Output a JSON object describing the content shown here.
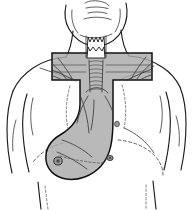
{
  "figure": {
    "caption_fragment": "",
    "background_color": "#ffffff",
    "line_color": "#1c1c1c",
    "field_fill_color": "#a9a9a9",
    "field_border_color": "#111111"
  },
  "anatomy": {
    "regions": [
      {
        "name": "chin-and-jaw",
        "label": "Chin and mandible"
      },
      {
        "name": "mouth",
        "label": "Mouth"
      },
      {
        "name": "neck",
        "label": "Neck"
      },
      {
        "name": "larynx",
        "label": "Larynx / thyroid cartilage"
      },
      {
        "name": "trachea",
        "label": "Trachea"
      },
      {
        "name": "left-shoulder",
        "label": "Left shoulder"
      },
      {
        "name": "right-shoulder",
        "label": "Right shoulder"
      },
      {
        "name": "left-arm",
        "label": "Left upper arm"
      },
      {
        "name": "right-arm",
        "label": "Right upper arm"
      },
      {
        "name": "chest",
        "label": "Chest / thorax"
      },
      {
        "name": "clavicle",
        "label": "Clavicle"
      },
      {
        "name": "axilla",
        "label": "Axilla"
      },
      {
        "name": "lymph-node",
        "label": "Lymph node"
      }
    ]
  },
  "treatment_field": {
    "name": "t-shaped-irradiation-field",
    "label": "T-shaped treatment field",
    "shape": "T-shape with inferior axillary extension",
    "fill": "#a9a9a9",
    "opacity": 0.82,
    "border": "#111111"
  },
  "caption": {
    "text": ""
  }
}
